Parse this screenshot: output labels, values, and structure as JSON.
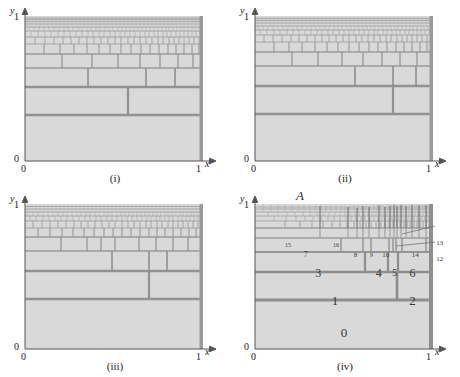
{
  "figure": {
    "background": "#ffffff",
    "fill_color": "#d9d9d9",
    "line_color": "#8a8a8a",
    "heavy_line_color": "#8f8f8f",
    "axis_color": "#555555",
    "text_color": "#1a1a1a"
  },
  "panels": [
    {
      "id": "i",
      "caption": "(i)",
      "axis": {
        "y_label": "y",
        "x_label": "x",
        "y_max": "1",
        "y_min": "0",
        "x_min": "0",
        "x_max": "1"
      }
    },
    {
      "id": "ii",
      "caption": "(ii)",
      "axis": {
        "y_label": "y",
        "x_label": "x",
        "y_max": "1",
        "y_min": "0",
        "x_min": "0",
        "x_max": "1"
      }
    },
    {
      "id": "iii",
      "caption": "(iii)",
      "axis": {
        "y_label": "y",
        "x_label": "x",
        "y_max": "1",
        "y_min": "0",
        "x_min": "0",
        "x_max": "1"
      }
    },
    {
      "id": "iv",
      "caption": "(iv)",
      "axis": {
        "y_label": "y",
        "x_label": "x",
        "y_max": "1",
        "y_min": "0",
        "x_min": "0",
        "x_max": "1"
      },
      "point_label": "A",
      "region_labels": [
        {
          "text": "0",
          "x": 0.5,
          "y": 0.115,
          "size": 13
        },
        {
          "text": "1",
          "x": 0.45,
          "y": 0.335,
          "size": 13
        },
        {
          "text": "2",
          "x": 0.885,
          "y": 0.335,
          "size": 13
        },
        {
          "text": "3",
          "x": 0.355,
          "y": 0.525,
          "size": 12
        },
        {
          "text": "4",
          "x": 0.695,
          "y": 0.525,
          "size": 12
        },
        {
          "text": "5",
          "x": 0.785,
          "y": 0.525,
          "size": 10
        },
        {
          "text": "6",
          "x": 0.885,
          "y": 0.525,
          "size": 12
        },
        {
          "text": "7",
          "x": 0.285,
          "y": 0.645,
          "size": 8
        },
        {
          "text": "8",
          "x": 0.565,
          "y": 0.645,
          "size": 7
        },
        {
          "text": "9",
          "x": 0.655,
          "y": 0.645,
          "size": 6
        },
        {
          "text": "10",
          "x": 0.735,
          "y": 0.645,
          "size": 7
        },
        {
          "text": "14",
          "x": 0.9,
          "y": 0.645,
          "size": 7
        },
        {
          "text": "15",
          "x": 0.185,
          "y": 0.72,
          "size": 6
        },
        {
          "text": "16",
          "x": 0.455,
          "y": 0.72,
          "size": 6
        }
      ],
      "callouts": [
        {
          "text": "13",
          "x": 0.985,
          "y": 0.73
        },
        {
          "text": "12",
          "x": 0.985,
          "y": 0.618
        }
      ]
    }
  ]
}
